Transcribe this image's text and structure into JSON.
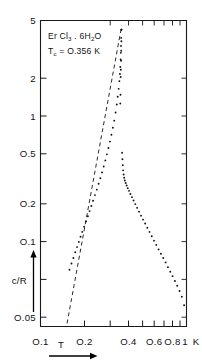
{
  "figure": {
    "name": "specific-heat-log-log-plot",
    "background_color": "#ffffff",
    "ink_color": "#111111"
  },
  "annotations": {
    "compound_prefix": "Er Cl",
    "compound_sub1": "3",
    "compound_mid": " . 6H",
    "compound_sub2": "2",
    "compound_suffix": "O",
    "tc_prefix": "T",
    "tc_sub": "c",
    "tc_value": " = O.356 K"
  },
  "axes": {
    "x": {
      "label": "T",
      "unit": "K",
      "scale": "log",
      "range": [
        0.1,
        1.0
      ],
      "tick_labels": [
        "O.1",
        "O.2",
        "O.4",
        "O.6",
        "O.8",
        "1"
      ],
      "tick_values": [
        0.1,
        0.2,
        0.4,
        0.6,
        0.8,
        1.0
      ],
      "minor_tick_values": [
        0.3,
        0.5,
        0.7,
        0.9
      ],
      "arrow": "right"
    },
    "y": {
      "label": "c/R",
      "scale": "log",
      "range": [
        0.04,
        5.0
      ],
      "tick_labels": [
        "5",
        "2",
        "1",
        "O.5",
        "O.2",
        "O.1",
        "O.05"
      ],
      "tick_values": [
        5,
        2,
        1,
        0.5,
        0.2,
        0.1,
        0.05
      ],
      "arrow": "up"
    }
  },
  "chart_data": {
    "type": "scatter",
    "xlabel": "T",
    "ylabel": "c/R",
    "xscale": "log",
    "yscale": "log",
    "xlim": [
      0.1,
      1.0
    ],
    "ylim": [
      0.04,
      5.0
    ],
    "grid": false,
    "legend": null,
    "annotations": [
      "Er Cl3 . 6H2O",
      "Tc = O.356 K"
    ],
    "critical_temperature_K": 0.356,
    "series": [
      {
        "name": "low-temperature-branch",
        "marker": "dot",
        "x": [
          0.158,
          0.163,
          0.168,
          0.173,
          0.178,
          0.183,
          0.188,
          0.193,
          0.199,
          0.205,
          0.211,
          0.217,
          0.223,
          0.229,
          0.236,
          0.243,
          0.25,
          0.257,
          0.264,
          0.271,
          0.278,
          0.285,
          0.292,
          0.299,
          0.306,
          0.313,
          0.32,
          0.327,
          0.333,
          0.338,
          0.343,
          0.347,
          0.35,
          0.352,
          0.354,
          0.355,
          0.356,
          0.357,
          0.358
        ],
        "y": [
          0.098,
          0.108,
          0.118,
          0.129,
          0.14,
          0.152,
          0.165,
          0.178,
          0.193,
          0.21,
          0.228,
          0.247,
          0.268,
          0.291,
          0.318,
          0.347,
          0.38,
          0.415,
          0.455,
          0.5,
          0.55,
          0.605,
          0.668,
          0.74,
          0.825,
          0.92,
          1.03,
          1.17,
          1.33,
          1.5,
          1.7,
          1.92,
          2.15,
          2.4,
          2.7,
          3.0,
          3.35,
          3.8,
          4.3
        ]
      },
      {
        "name": "high-temperature-branch",
        "marker": "dot",
        "x": [
          0.362,
          0.364,
          0.366,
          0.368,
          0.371,
          0.374,
          0.378,
          0.383,
          0.389,
          0.396,
          0.404,
          0.413,
          0.423,
          0.434,
          0.446,
          0.459,
          0.473,
          0.488,
          0.504,
          0.521,
          0.539,
          0.558,
          0.578,
          0.599,
          0.621,
          0.644,
          0.668,
          0.693,
          0.719,
          0.746,
          0.774,
          0.803,
          0.833,
          0.864,
          0.896,
          0.929,
          0.963
        ],
        "y": [
          0.62,
          0.56,
          0.51,
          0.47,
          0.44,
          0.418,
          0.4,
          0.385,
          0.37,
          0.355,
          0.34,
          0.324,
          0.308,
          0.292,
          0.276,
          0.26,
          0.245,
          0.23,
          0.216,
          0.203,
          0.19,
          0.178,
          0.166,
          0.155,
          0.145,
          0.135,
          0.126,
          0.118,
          0.11,
          0.102,
          0.095,
          0.0885,
          0.082,
          0.076,
          0.07,
          0.064,
          0.056
        ]
      },
      {
        "name": "upper-peak-cluster",
        "marker": "dot",
        "x": [
          0.352,
          0.353,
          0.354,
          0.355,
          0.356,
          0.357,
          0.358,
          0.359
        ],
        "y": [
          1.35,
          1.55,
          2.05,
          2.3,
          2.65,
          3.1,
          3.6,
          4.35
        ]
      }
    ],
    "reference_line": {
      "name": "asymptote-dashed-line",
      "style": "dashed",
      "x": [
        0.152,
        0.36
      ],
      "y": [
        0.042,
        4.6
      ]
    }
  }
}
